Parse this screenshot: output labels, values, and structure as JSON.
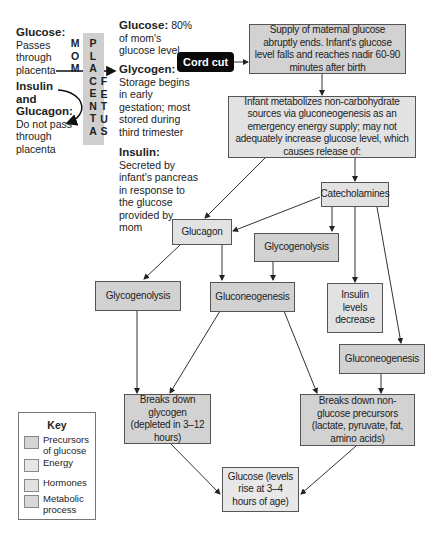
{
  "left_notes": {
    "glucose": {
      "title": "Glucose:",
      "text": [
        "Passes",
        "through",
        "placenta"
      ]
    },
    "insulin_glucagon": {
      "title": [
        "Insulin",
        "and",
        "Glucagon:"
      ],
      "text": [
        "Do not pass",
        "through",
        "placenta"
      ]
    }
  },
  "placenta_column": {
    "mom_letters": [
      "M",
      "O",
      "M"
    ],
    "placenta_letters": [
      "P",
      "L",
      "A",
      "C",
      "E",
      "N",
      "T",
      "A"
    ],
    "fetus_letters": [
      "F",
      "E",
      "T",
      "U",
      "S"
    ]
  },
  "fetus_notes": {
    "glucose": {
      "title": "Glucose:",
      "text": [
        "80%",
        "of mom's",
        "glucose level"
      ]
    },
    "glycogen": {
      "title": "Glycogen:",
      "text": [
        "Storage begins",
        "in early",
        "gestation; most",
        "stored during",
        "third trimester"
      ]
    },
    "insulin": {
      "title": "Insulin:",
      "text": [
        "Secreted by",
        "infant's pancreas",
        "in response to",
        "the glucose",
        "provided by",
        "mom"
      ]
    }
  },
  "nodes": {
    "cord_cut": "Cord cut",
    "supply_ends": "Supply of maternal glucose abruptly ends. Infant's glucose level falls and reaches nadir 60-90 minutes after birth",
    "infant_metabolizes": "Infant metabolizes non-carbohydrate sources via gluconeogenesis as an emergency energy supply; may not adequately increase glucose level, which causes release of:",
    "catecholamines": "Catecholamines",
    "glucagon": "Glucagon",
    "glycogenolysis_mid": "Glycogenolysis",
    "glycogenolysis_left": "Glycogenolysis",
    "gluconeogenesis_mid": "Gluconeogenesis",
    "insulin_decrease": "Insulin levels decrease",
    "gluconeogenesis_right": "Gluconeogenesis",
    "breaks_glycogen": "Breaks down glycogen (depleted in 3–12 hours)",
    "breaks_nonglucose": "Breaks down non-glucose precursors (lactate, pyruvate, fat, amino acids)",
    "glucose_final": "Glucose (levels rise at 3–4 hours of age)"
  },
  "key": {
    "title": "Key",
    "items": [
      {
        "label": "Precursors of glucose",
        "color": "#d4d4d4"
      },
      {
        "label": "Energy",
        "color": "#e6e6e6"
      },
      {
        "label": "Hormones",
        "color": "#e2e2e2"
      },
      {
        "label": "Metabolic process",
        "color": "#d8d8d8"
      }
    ]
  },
  "colors": {
    "box_fill": "#e2e2e2",
    "box_border": "#555555",
    "placenta_band": "#cfcfcf",
    "cord_cut_bg": "#0a0a0a"
  }
}
